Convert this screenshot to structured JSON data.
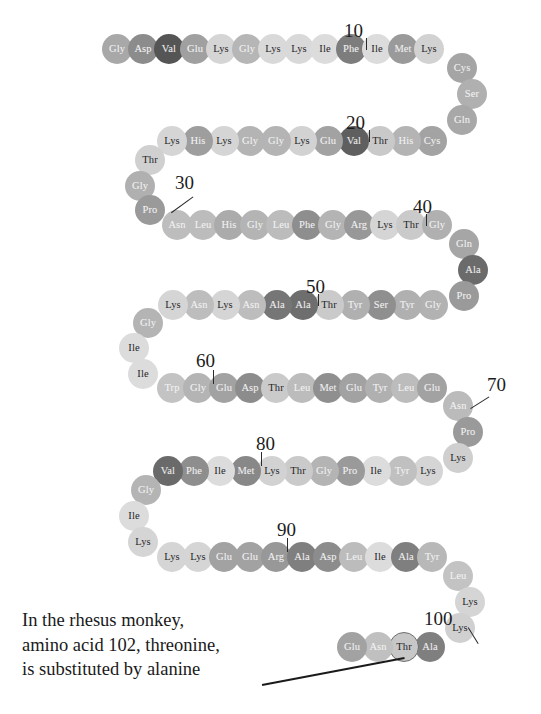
{
  "figure": {
    "type": "protein-sequence-diagram",
    "molecule": "cytochrome c",
    "caption_lines": [
      "In the rhesus monkey,",
      "amino acid 102, threonine,",
      "is substituted by alanine"
    ],
    "highlighted_residue_position": 102,
    "highlighted_residue_name": "Thr",
    "position_labels": [
      "10",
      "20",
      "30",
      "40",
      "50",
      "60",
      "70",
      "80",
      "90",
      "100"
    ],
    "colors": {
      "background": "#ffffff",
      "text_dark": "#1a1a1a",
      "leader_line": "#2a2a2a",
      "ring_stroke": "#6f6f6f"
    },
    "residues": [
      {
        "n": 1,
        "label": "Gly",
        "x": 117,
        "y": 49,
        "fill": "#a8a8a8",
        "text": "#f2f2f2"
      },
      {
        "n": 2,
        "label": "Asp",
        "x": 143,
        "y": 49,
        "fill": "#8c8c8c",
        "text": "#f4f4f4"
      },
      {
        "n": 3,
        "label": "Val",
        "x": 169,
        "y": 49,
        "fill": "#555555",
        "text": "#ededed"
      },
      {
        "n": 4,
        "label": "Glu",
        "x": 195,
        "y": 49,
        "fill": "#a0a0a0",
        "text": "#f4f4f4"
      },
      {
        "n": 5,
        "label": "Lys",
        "x": 221,
        "y": 49,
        "fill": "#d5d5d5",
        "text": "#242424"
      },
      {
        "n": 6,
        "label": "Gly",
        "x": 247,
        "y": 49,
        "fill": "#b6b6b6",
        "text": "#f2f2f2"
      },
      {
        "n": 7,
        "label": "Lys",
        "x": 273,
        "y": 49,
        "fill": "#d9d9d9",
        "text": "#242424"
      },
      {
        "n": 8,
        "label": "Lys",
        "x": 299,
        "y": 49,
        "fill": "#d9d9d9",
        "text": "#242424"
      },
      {
        "n": 9,
        "label": "Ile",
        "x": 325,
        "y": 49,
        "fill": "#dcdcdc",
        "text": "#242424"
      },
      {
        "n": 10,
        "label": "Phe",
        "x": 351,
        "y": 49,
        "fill": "#7d7d7d",
        "text": "#f2f2f2"
      },
      {
        "n": 11,
        "label": "Ile",
        "x": 377,
        "y": 49,
        "fill": "#dcdcdc",
        "text": "#242424"
      },
      {
        "n": 12,
        "label": "Met",
        "x": 403,
        "y": 49,
        "fill": "#9a9a9a",
        "text": "#efefef"
      },
      {
        "n": 13,
        "label": "Lys",
        "x": 429,
        "y": 49,
        "fill": "#d2d2d2",
        "text": "#242424"
      },
      {
        "n": 14,
        "label": "Cys",
        "x": 462,
        "y": 68,
        "fill": "#a5a5a5",
        "text": "#f2f2f2"
      },
      {
        "n": 15,
        "label": "Ser",
        "x": 472,
        "y": 94,
        "fill": "#b0b0b0",
        "text": "#f2f2f2"
      },
      {
        "n": 16,
        "label": "Gln",
        "x": 462,
        "y": 120,
        "fill": "#a8a8a8",
        "text": "#f2f2f2"
      },
      {
        "n": 17,
        "label": "Cys",
        "x": 432,
        "y": 141,
        "fill": "#a3a3a3",
        "text": "#f2f2f2"
      },
      {
        "n": 18,
        "label": "His",
        "x": 406,
        "y": 141,
        "fill": "#b4b4b4",
        "text": "#f2f2f2"
      },
      {
        "n": 19,
        "label": "Thr",
        "x": 380,
        "y": 141,
        "fill": "#c9c9c9",
        "text": "#242424"
      },
      {
        "n": 20,
        "label": "Val",
        "x": 354,
        "y": 141,
        "fill": "#5f5f5f",
        "text": "#ededed"
      },
      {
        "n": 21,
        "label": "Glu",
        "x": 328,
        "y": 141,
        "fill": "#a2a2a2",
        "text": "#f2f2f2"
      },
      {
        "n": 22,
        "label": "Lys",
        "x": 302,
        "y": 141,
        "fill": "#d2d2d2",
        "text": "#242424"
      },
      {
        "n": 23,
        "label": "Gly",
        "x": 276,
        "y": 141,
        "fill": "#b4b4b4",
        "text": "#f2f2f2"
      },
      {
        "n": 24,
        "label": "Gly",
        "x": 250,
        "y": 141,
        "fill": "#b4b4b4",
        "text": "#f2f2f2"
      },
      {
        "n": 25,
        "label": "Lys",
        "x": 224,
        "y": 141,
        "fill": "#d5d5d5",
        "text": "#242424"
      },
      {
        "n": 26,
        "label": "His",
        "x": 198,
        "y": 141,
        "fill": "#9e9e9e",
        "text": "#f2f2f2"
      },
      {
        "n": 27,
        "label": "Lys",
        "x": 172,
        "y": 141,
        "fill": "#d5d5d5",
        "text": "#242424"
      },
      {
        "n": 28,
        "label": "Thr",
        "x": 150,
        "y": 160,
        "fill": "#d0d0d0",
        "text": "#242424"
      },
      {
        "n": 29,
        "label": "Gly",
        "x": 140,
        "y": 186,
        "fill": "#b0b0b0",
        "text": "#f2f2f2"
      },
      {
        "n": 30,
        "label": "Pro",
        "x": 150,
        "y": 210,
        "fill": "#9a9a9a",
        "text": "#f2f2f2"
      },
      {
        "n": 31,
        "label": "Asn",
        "x": 177,
        "y": 225,
        "fill": "#bdbdbd",
        "text": "#f2f2f2"
      },
      {
        "n": 32,
        "label": "Leu",
        "x": 203,
        "y": 225,
        "fill": "#bcbcbc",
        "text": "#f2f2f2"
      },
      {
        "n": 33,
        "label": "His",
        "x": 229,
        "y": 225,
        "fill": "#ababab",
        "text": "#f2f2f2"
      },
      {
        "n": 34,
        "label": "Gly",
        "x": 255,
        "y": 225,
        "fill": "#b4b4b4",
        "text": "#f2f2f2"
      },
      {
        "n": 35,
        "label": "Leu",
        "x": 281,
        "y": 225,
        "fill": "#bcbcbc",
        "text": "#f2f2f2"
      },
      {
        "n": 36,
        "label": "Phe",
        "x": 307,
        "y": 225,
        "fill": "#8e8e8e",
        "text": "#f2f2f2"
      },
      {
        "n": 37,
        "label": "Gly",
        "x": 333,
        "y": 225,
        "fill": "#b4b4b4",
        "text": "#f2f2f2"
      },
      {
        "n": 38,
        "label": "Arg",
        "x": 359,
        "y": 225,
        "fill": "#989898",
        "text": "#f2f2f2"
      },
      {
        "n": 39,
        "label": "Lys",
        "x": 385,
        "y": 225,
        "fill": "#d5d5d5",
        "text": "#242424"
      },
      {
        "n": 40,
        "label": "Thr",
        "x": 411,
        "y": 225,
        "fill": "#cacaca",
        "text": "#242424"
      },
      {
        "n": 41,
        "label": "Gly",
        "x": 437,
        "y": 225,
        "fill": "#b0b0b0",
        "text": "#f2f2f2"
      },
      {
        "n": 42,
        "label": "Gln",
        "x": 464,
        "y": 244,
        "fill": "#a6a6a6",
        "text": "#f2f2f2"
      },
      {
        "n": 43,
        "label": "Ala",
        "x": 473,
        "y": 270,
        "fill": "#6b6b6b",
        "text": "#efefef"
      },
      {
        "n": 44,
        "label": "Pro",
        "x": 464,
        "y": 296,
        "fill": "#9a9a9a",
        "text": "#f2f2f2"
      },
      {
        "n": 45,
        "label": "Gly",
        "x": 433,
        "y": 305,
        "fill": "#b2b2b2",
        "text": "#f2f2f2"
      },
      {
        "n": 46,
        "label": "Tyr",
        "x": 407,
        "y": 305,
        "fill": "#b0b0b0",
        "text": "#f2f2f2"
      },
      {
        "n": 47,
        "label": "Ser",
        "x": 381,
        "y": 305,
        "fill": "#8f8f8f",
        "text": "#f2f2f2"
      },
      {
        "n": 48,
        "label": "Tyr",
        "x": 355,
        "y": 305,
        "fill": "#b0b0b0",
        "text": "#f2f2f2"
      },
      {
        "n": 49,
        "label": "Thr",
        "x": 329,
        "y": 305,
        "fill": "#cacaca",
        "text": "#242424"
      },
      {
        "n": 50,
        "label": "Ala",
        "x": 303,
        "y": 305,
        "fill": "#6e6e6e",
        "text": "#efefef"
      },
      {
        "n": 51,
        "label": "Ala",
        "x": 277,
        "y": 305,
        "fill": "#767676",
        "text": "#efefef"
      },
      {
        "n": 52,
        "label": "Asn",
        "x": 251,
        "y": 305,
        "fill": "#bdbdbd",
        "text": "#f2f2f2"
      },
      {
        "n": 53,
        "label": "Lys",
        "x": 225,
        "y": 305,
        "fill": "#d5d5d5",
        "text": "#242424"
      },
      {
        "n": 54,
        "label": "Asn",
        "x": 199,
        "y": 305,
        "fill": "#bdbdbd",
        "text": "#f2f2f2"
      },
      {
        "n": 55,
        "label": "Lys",
        "x": 173,
        "y": 305,
        "fill": "#d5d5d5",
        "text": "#242424"
      },
      {
        "n": 56,
        "label": "Gly",
        "x": 148,
        "y": 323,
        "fill": "#b4b4b4",
        "text": "#f2f2f2"
      },
      {
        "n": 57,
        "label": "Ile",
        "x": 134,
        "y": 348,
        "fill": "#dcdcdc",
        "text": "#242424"
      },
      {
        "n": 58,
        "label": "Ile",
        "x": 143,
        "y": 374,
        "fill": "#dcdcdc",
        "text": "#242424"
      },
      {
        "n": 59,
        "label": "Trp",
        "x": 172,
        "y": 388,
        "fill": "#c3c3c3",
        "text": "#f2f2f2"
      },
      {
        "n": 60,
        "label": "Gly",
        "x": 198,
        "y": 388,
        "fill": "#b4b4b4",
        "text": "#f2f2f2"
      },
      {
        "n": 61,
        "label": "Glu",
        "x": 224,
        "y": 388,
        "fill": "#a2a2a2",
        "text": "#f2f2f2"
      },
      {
        "n": 62,
        "label": "Asp",
        "x": 250,
        "y": 388,
        "fill": "#8c8c8c",
        "text": "#f2f2f2"
      },
      {
        "n": 63,
        "label": "Thr",
        "x": 276,
        "y": 388,
        "fill": "#cacaca",
        "text": "#242424"
      },
      {
        "n": 64,
        "label": "Leu",
        "x": 302,
        "y": 388,
        "fill": "#bcbcbc",
        "text": "#f2f2f2"
      },
      {
        "n": 65,
        "label": "Met",
        "x": 328,
        "y": 388,
        "fill": "#8f8f8f",
        "text": "#efefef"
      },
      {
        "n": 66,
        "label": "Glu",
        "x": 354,
        "y": 388,
        "fill": "#a2a2a2",
        "text": "#f2f2f2"
      },
      {
        "n": 67,
        "label": "Tyr",
        "x": 380,
        "y": 388,
        "fill": "#b0b0b0",
        "text": "#f2f2f2"
      },
      {
        "n": 68,
        "label": "Leu",
        "x": 406,
        "y": 388,
        "fill": "#bcbcbc",
        "text": "#f2f2f2"
      },
      {
        "n": 69,
        "label": "Glu",
        "x": 432,
        "y": 388,
        "fill": "#a2a2a2",
        "text": "#f2f2f2"
      },
      {
        "n": 70,
        "label": "Asn",
        "x": 458,
        "y": 406,
        "fill": "#bbbbbb",
        "text": "#f2f2f2"
      },
      {
        "n": 71,
        "label": "Pro",
        "x": 468,
        "y": 432,
        "fill": "#9a9a9a",
        "text": "#f2f2f2"
      },
      {
        "n": 72,
        "label": "Lys",
        "x": 458,
        "y": 458,
        "fill": "#cfcfcf",
        "text": "#242424"
      },
      {
        "n": 73,
        "label": "Lys",
        "x": 428,
        "y": 471,
        "fill": "#d5d5d5",
        "text": "#242424"
      },
      {
        "n": 74,
        "label": "Tyr",
        "x": 402,
        "y": 471,
        "fill": "#c0c0c0",
        "text": "#f2f2f2"
      },
      {
        "n": 75,
        "label": "Ile",
        "x": 376,
        "y": 471,
        "fill": "#dcdcdc",
        "text": "#242424"
      },
      {
        "n": 76,
        "label": "Pro",
        "x": 350,
        "y": 471,
        "fill": "#9a9a9a",
        "text": "#f2f2f2"
      },
      {
        "n": 77,
        "label": "Gly",
        "x": 324,
        "y": 471,
        "fill": "#b4b4b4",
        "text": "#f2f2f2"
      },
      {
        "n": 78,
        "label": "Thr",
        "x": 298,
        "y": 471,
        "fill": "#cacaca",
        "text": "#242424"
      },
      {
        "n": 79,
        "label": "Lys",
        "x": 272,
        "y": 471,
        "fill": "#d2d2d2",
        "text": "#242424"
      },
      {
        "n": 80,
        "label": "Met",
        "x": 246,
        "y": 471,
        "fill": "#888888",
        "text": "#efefef"
      },
      {
        "n": 81,
        "label": "Ile",
        "x": 220,
        "y": 471,
        "fill": "#dcdcdc",
        "text": "#242424"
      },
      {
        "n": 82,
        "label": "Phe",
        "x": 194,
        "y": 471,
        "fill": "#8e8e8e",
        "text": "#f2f2f2"
      },
      {
        "n": 83,
        "label": "Val",
        "x": 168,
        "y": 471,
        "fill": "#6a6a6a",
        "text": "#ededed"
      },
      {
        "n": 84,
        "label": "Gly",
        "x": 146,
        "y": 490,
        "fill": "#b4b4b4",
        "text": "#f2f2f2"
      },
      {
        "n": 85,
        "label": "Ile",
        "x": 134,
        "y": 516,
        "fill": "#dcdcdc",
        "text": "#242424"
      },
      {
        "n": 86,
        "label": "Lys",
        "x": 143,
        "y": 542,
        "fill": "#d5d5d5",
        "text": "#242424"
      },
      {
        "n": 87,
        "label": "Lys",
        "x": 172,
        "y": 557,
        "fill": "#d5d5d5",
        "text": "#242424"
      },
      {
        "n": 88,
        "label": "Lys",
        "x": 198,
        "y": 557,
        "fill": "#d5d5d5",
        "text": "#242424"
      },
      {
        "n": 89,
        "label": "Glu",
        "x": 224,
        "y": 557,
        "fill": "#a2a2a2",
        "text": "#f2f2f2"
      },
      {
        "n": 90,
        "label": "Glu",
        "x": 250,
        "y": 557,
        "fill": "#a2a2a2",
        "text": "#f2f2f2"
      },
      {
        "n": 91,
        "label": "Arg",
        "x": 276,
        "y": 557,
        "fill": "#989898",
        "text": "#f2f2f2"
      },
      {
        "n": 92,
        "label": "Ala",
        "x": 302,
        "y": 557,
        "fill": "#7f7f7f",
        "text": "#efefef"
      },
      {
        "n": 93,
        "label": "Asp",
        "x": 328,
        "y": 557,
        "fill": "#8c8c8c",
        "text": "#f2f2f2"
      },
      {
        "n": 94,
        "label": "Leu",
        "x": 354,
        "y": 557,
        "fill": "#bcbcbc",
        "text": "#f2f2f2"
      },
      {
        "n": 95,
        "label": "Ile",
        "x": 380,
        "y": 557,
        "fill": "#dcdcdc",
        "text": "#242424"
      },
      {
        "n": 96,
        "label": "Ala",
        "x": 406,
        "y": 557,
        "fill": "#7f7f7f",
        "text": "#efefef"
      },
      {
        "n": 97,
        "label": "Tyr",
        "x": 432,
        "y": 557,
        "fill": "#b8b8b8",
        "text": "#f2f2f2"
      },
      {
        "n": 98,
        "label": "Leu",
        "x": 458,
        "y": 576,
        "fill": "#c3c3c3",
        "text": "#f2f2f2"
      },
      {
        "n": 99,
        "label": "Lys",
        "x": 470,
        "y": 602,
        "fill": "#d5d5d5",
        "text": "#242424"
      },
      {
        "n": 100,
        "label": "Lys",
        "x": 460,
        "y": 628,
        "fill": "#d0d0d0",
        "text": "#242424"
      },
      {
        "n": 101,
        "label": "Ala",
        "x": 430,
        "y": 647,
        "fill": "#7f7f7f",
        "text": "#efefef"
      },
      {
        "n": 102,
        "label": "Thr",
        "x": 404,
        "y": 647,
        "fill": "#c7c7c7",
        "text": "#242424",
        "ring": true
      },
      {
        "n": 103,
        "label": "Asn",
        "x": 378,
        "y": 647,
        "fill": "#c0c0c0",
        "text": "#f2f2f2"
      },
      {
        "n": 104,
        "label": "Glu",
        "x": 352,
        "y": 647,
        "fill": "#a2a2a2",
        "text": "#f2f2f2"
      }
    ],
    "number_markers": [
      {
        "text": "10",
        "x": 344,
        "y": 20,
        "tick": {
          "x": 366,
          "y": 38,
          "h": 12
        }
      },
      {
        "text": "20",
        "x": 346,
        "y": 112,
        "tick": {
          "x": 369,
          "y": 130,
          "h": 12
        }
      },
      {
        "text": "30",
        "x": 175,
        "y": 172,
        "leader": {
          "x1": 193,
          "y1": 196,
          "x2": 171,
          "y2": 212
        }
      },
      {
        "text": "40",
        "x": 413,
        "y": 196,
        "tick": {
          "x": 426,
          "y": 214,
          "h": 12
        }
      },
      {
        "text": "50",
        "x": 306,
        "y": 276,
        "tick": {
          "x": 318,
          "y": 294,
          "h": 12
        }
      },
      {
        "text": "60",
        "x": 196,
        "y": 350,
        "tick": {
          "x": 213,
          "y": 370,
          "h": 14
        }
      },
      {
        "text": "70",
        "x": 487,
        "y": 374,
        "leader": {
          "x1": 489,
          "y1": 396,
          "x2": 470,
          "y2": 408
        }
      },
      {
        "text": "80",
        "x": 256,
        "y": 433,
        "tick": {
          "x": 261,
          "y": 452,
          "h": 14
        }
      },
      {
        "text": "90",
        "x": 277,
        "y": 519,
        "tick": {
          "x": 287,
          "y": 538,
          "h": 14
        }
      },
      {
        "text": "100",
        "x": 424,
        "y": 608,
        "leader": {
          "x1": 468,
          "y1": 627,
          "x2": 478,
          "y2": 643
        }
      }
    ],
    "callout": {
      "x1": 262,
      "y1": 684,
      "x2": 404,
      "y2": 657
    }
  }
}
